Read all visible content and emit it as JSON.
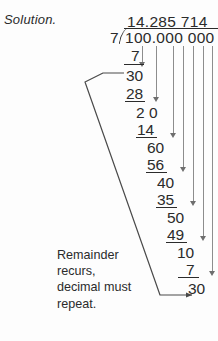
{
  "label": "Solution.",
  "division": {
    "quotient": "14.285 714",
    "divisor": "7",
    "dividend": "100.000 000",
    "bracket_glyph": ")"
  },
  "note": "Remainder\nrecurs,\ndecimal must\nrepeat.",
  "steps": [
    {
      "subtrahend": "7",
      "remainder": "30"
    },
    {
      "subtrahend": "28",
      "remainder": "2 0"
    },
    {
      "subtrahend": "14",
      "remainder": "60"
    },
    {
      "subtrahend": "56",
      "remainder": "40"
    },
    {
      "subtrahend": "35",
      "remainder": "50"
    },
    {
      "subtrahend": "49",
      "remainder": "10"
    },
    {
      "subtrahend": "7",
      "remainder": "30"
    }
  ],
  "work_lines": {
    "s1": "7",
    "r1": "30",
    "s2": "28",
    "r2": "2 0",
    "s3": "14",
    "r3": "60",
    "s4": "56",
    "r4": "40",
    "s5": "35",
    "r5": "50",
    "s6": "49",
    "r6": "10",
    "s7": "7",
    "r7": "30"
  },
  "colors": {
    "ink": "#2b2b2b",
    "guide_line": "#8d8d8d",
    "arrow": "#6e6e6e",
    "connector": "#4a4a4a",
    "background": "#fdfdfd"
  }
}
